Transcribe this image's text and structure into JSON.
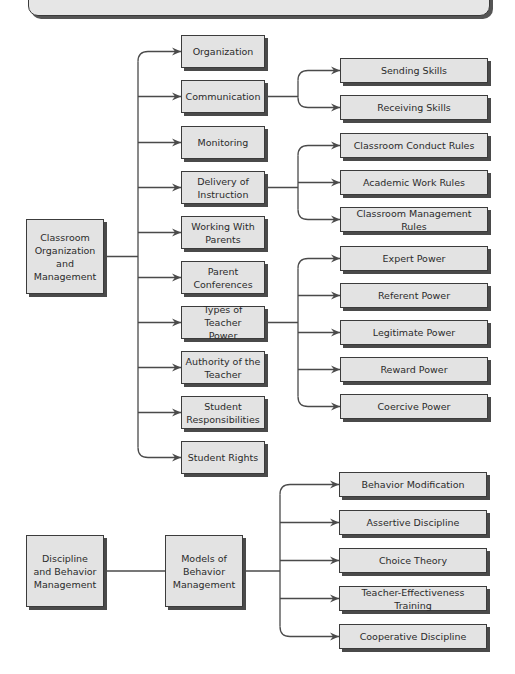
{
  "diagram": {
    "line_color": "#4a4a4a",
    "box_fill": "#e3e3e3",
    "roots": [
      {
        "id": "classroom",
        "label": "Classroom\nOrganization\nand\nManagement",
        "box": [
          26,
          219,
          78,
          75
        ]
      },
      {
        "id": "discipline",
        "label": "Discipline\nand Behavior\nManagement",
        "box": [
          26,
          535,
          78,
          72
        ]
      }
    ],
    "level1": [
      {
        "id": "organization",
        "label": "Organization",
        "box": [
          181,
          35,
          84,
          33
        ]
      },
      {
        "id": "communication",
        "label": "Communication",
        "box": [
          181,
          80,
          84,
          33
        ]
      },
      {
        "id": "monitoring",
        "label": "Monitoring",
        "box": [
          181,
          126,
          84,
          33
        ]
      },
      {
        "id": "delivery",
        "label": "Delivery of\nInstruction",
        "box": [
          181,
          171,
          84,
          33
        ]
      },
      {
        "id": "working-parents",
        "label": "Working With\nParents",
        "box": [
          181,
          216,
          84,
          33
        ]
      },
      {
        "id": "parent-conferences",
        "label": "Parent\nConferences",
        "box": [
          181,
          261,
          84,
          33
        ]
      },
      {
        "id": "teacher-power",
        "label": "Types of Teacher\nPower",
        "box": [
          181,
          306,
          84,
          33
        ]
      },
      {
        "id": "authority",
        "label": "Authority of the\nTeacher",
        "box": [
          181,
          351,
          84,
          33
        ]
      },
      {
        "id": "student-responsibilities",
        "label": "Student\nResponsibilities",
        "box": [
          181,
          396,
          84,
          33
        ]
      },
      {
        "id": "student-rights",
        "label": "Student Rights",
        "box": [
          181,
          441,
          84,
          33
        ]
      },
      {
        "id": "models",
        "label": "Models of\nBehavior\nManagement",
        "box": [
          165,
          535,
          78,
          72
        ]
      }
    ],
    "level2": [
      {
        "id": "sending",
        "parent": "communication",
        "label": "Sending Skills",
        "box": [
          340,
          58,
          148,
          25
        ]
      },
      {
        "id": "receiving",
        "parent": "communication",
        "label": "Receiving Skills",
        "box": [
          340,
          95,
          148,
          25
        ]
      },
      {
        "id": "conduct-rules",
        "parent": "delivery",
        "label": "Classroom Conduct Rules",
        "box": [
          340,
          133,
          148,
          25
        ]
      },
      {
        "id": "academic-rules",
        "parent": "delivery",
        "label": "Academic Work Rules",
        "box": [
          340,
          170,
          148,
          25
        ]
      },
      {
        "id": "management-rules",
        "parent": "delivery",
        "label": "Classroom Management Rules",
        "box": [
          340,
          207,
          148,
          25
        ]
      },
      {
        "id": "expert",
        "parent": "teacher-power",
        "label": "Expert Power",
        "box": [
          340,
          246,
          148,
          25
        ]
      },
      {
        "id": "referent",
        "parent": "teacher-power",
        "label": "Referent Power",
        "box": [
          340,
          283,
          148,
          25
        ]
      },
      {
        "id": "legitimate",
        "parent": "teacher-power",
        "label": "Legitimate Power",
        "box": [
          340,
          320,
          148,
          25
        ]
      },
      {
        "id": "reward",
        "parent": "teacher-power",
        "label": "Reward Power",
        "box": [
          340,
          357,
          148,
          25
        ]
      },
      {
        "id": "coercive",
        "parent": "teacher-power",
        "label": "Coercive Power",
        "box": [
          340,
          394,
          148,
          25
        ]
      },
      {
        "id": "behavior-mod",
        "parent": "models",
        "label": "Behavior Modification",
        "box": [
          339,
          472,
          148,
          25
        ]
      },
      {
        "id": "assertive",
        "parent": "models",
        "label": "Assertive Discipline",
        "box": [
          339,
          510,
          148,
          25
        ]
      },
      {
        "id": "choice",
        "parent": "models",
        "label": "Choice Theory",
        "box": [
          339,
          548,
          148,
          25
        ]
      },
      {
        "id": "teacher-effectiveness",
        "parent": "models",
        "label": "Teacher-Effectiveness Training",
        "box": [
          339,
          586,
          148,
          25
        ]
      },
      {
        "id": "cooperative",
        "parent": "models",
        "label": "Cooperative Discipline",
        "box": [
          339,
          624,
          148,
          25
        ]
      }
    ]
  }
}
